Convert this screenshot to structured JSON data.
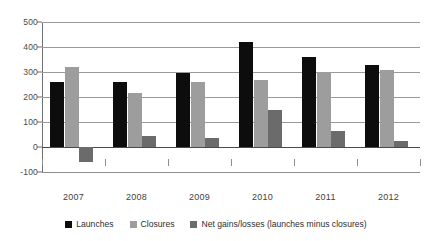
{
  "chart_data": {
    "type": "bar",
    "title": "",
    "xlabel": "",
    "ylabel": "",
    "categories": [
      "2007",
      "2008",
      "2009",
      "2010",
      "2011",
      "2012"
    ],
    "series": [
      {
        "name": "Launches",
        "color": "#0d0d0d",
        "values": [
          260,
          260,
          295,
          420,
          360,
          330
        ]
      },
      {
        "name": "Closures",
        "color": "#9d9d9d",
        "values": [
          320,
          215,
          260,
          270,
          300,
          310
        ]
      },
      {
        "name": "Net gains/losses (launches minus closures)",
        "color": "#6b6b6b",
        "values": [
          -60,
          45,
          35,
          150,
          65,
          25
        ]
      }
    ],
    "ylim": [
      -100,
      500
    ],
    "y_ticks": [
      500,
      400,
      300,
      200,
      100,
      0,
      -100
    ],
    "y_tick_labels": [
      "500",
      "400",
      "300",
      "200",
      "100",
      "0",
      "-100"
    ],
    "grid": true,
    "legend_position": "bottom"
  },
  "legend": {
    "items": [
      {
        "label": "Launches"
      },
      {
        "label": "Closures"
      },
      {
        "label": "Net gains/losses (launches minus closures)"
      }
    ]
  }
}
